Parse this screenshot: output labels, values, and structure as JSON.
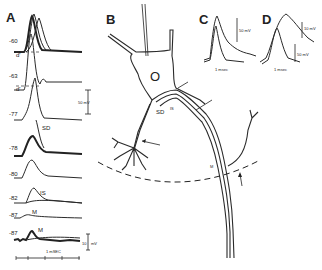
{
  "figure": {
    "panels": {
      "A": "A",
      "B": "B",
      "C": "C",
      "D": "D"
    },
    "panel_A": {
      "traces": [
        {
          "potential": "-60",
          "marker": "d'"
        },
        {
          "potential": "-63",
          "marker": "d'"
        },
        {
          "potential": "-77",
          "label": "SD"
        },
        {
          "potential": "-78"
        },
        {
          "potential": "-80"
        },
        {
          "potential": "-82",
          "label": "IS"
        },
        {
          "potential": "-87",
          "label": "M"
        },
        {
          "potential": "-87",
          "label": "M"
        }
      ],
      "scale_bar_top": "50 mV",
      "scale_bar_bottom_value": "10",
      "scale_bar_bottom_unit": "mV",
      "time_bar": "1 mSEC"
    },
    "panel_B": {
      "soma_label": "O",
      "labels": {
        "sd": "SD",
        "is": "IS",
        "m": "M"
      }
    },
    "panel_C": {
      "scale_bar": "50 mV",
      "time_bar": "1 msec"
    },
    "panel_D": {
      "scale_bar_top": "10 mV",
      "scale_bar_bottom": "50 mV",
      "time_bar": "1 msec"
    }
  }
}
